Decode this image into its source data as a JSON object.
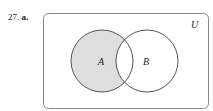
{
  "problem": {
    "number": "27.",
    "part": "a."
  },
  "venn": {
    "universe_label": "U",
    "sets": [
      {
        "label": "A",
        "cx": 102,
        "cy": 61,
        "r": 31
      },
      {
        "label": "B",
        "cx": 147,
        "cy": 61,
        "r": 31
      }
    ],
    "shaded_region": "A only (A minus B)",
    "colors": {
      "shade": "#dedede",
      "stroke": "#555555",
      "border": "#888888"
    }
  }
}
